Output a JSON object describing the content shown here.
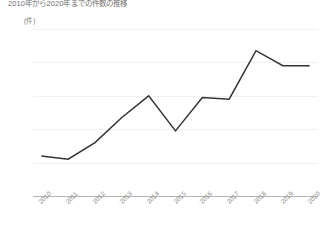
{
  "chart_title": "2010年から2020年までの件数の推移",
  "unit_label": "(件)",
  "axis": {
    "y_ticks": [
      "160",
      "140",
      "120",
      "100",
      "80",
      "60"
    ],
    "x_ticks": [
      "2010",
      "2011",
      "2012",
      "2013",
      "2014",
      "2015",
      "2016",
      "2017",
      "2018",
      "2019",
      "2020"
    ]
  },
  "style": {
    "line_color": "#333333",
    "grid_color": "#f0f0f0",
    "axis_color": "#b5b5b5",
    "label_color": "#7a7a7a",
    "background": "#ffffff"
  },
  "chart_data": {
    "type": "line",
    "title": "2010年から2020年までの件数の推移",
    "xlabel": "",
    "ylabel": "(件)",
    "ylim": [
      60,
      160
    ],
    "ytick_step": 20,
    "grid": true,
    "legend": false,
    "categories": [
      "2010",
      "2011",
      "2012",
      "2013",
      "2014",
      "2015",
      "2016",
      "2017",
      "2018",
      "2019",
      "2020"
    ],
    "values": [
      84,
      82,
      92,
      107,
      120,
      99,
      119,
      118,
      147,
      138,
      138
    ],
    "series": [
      {
        "name": "件数",
        "color": "#333333",
        "values": [
          84,
          82,
          92,
          107,
          120,
          99,
          119,
          118,
          147,
          138,
          138
        ]
      }
    ]
  }
}
